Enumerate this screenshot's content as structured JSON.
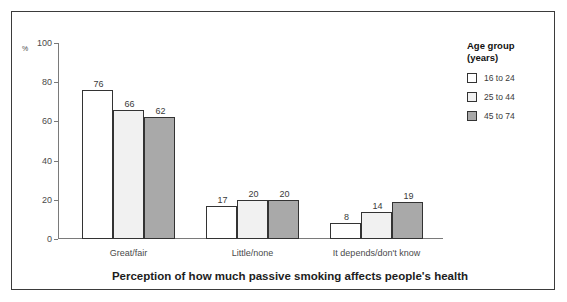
{
  "chart_data": {
    "type": "bar",
    "title": "",
    "xlabel": "Perception of how much passive smoking affects people's health",
    "ylabel": "%",
    "categories": [
      "Great/fair",
      "Little/none",
      "It depends/don't know"
    ],
    "series": [
      {
        "name": "16 to 24",
        "values": [
          76,
          17,
          8
        ],
        "color": "#ffffff"
      },
      {
        "name": "25 to 44",
        "values": [
          66,
          20,
          14
        ],
        "color": "#f1f1f1"
      },
      {
        "name": "45 to 74",
        "values": [
          62,
          20,
          19
        ],
        "color": "#a9a9a9"
      }
    ],
    "ylim": [
      0,
      100
    ],
    "yticks": [
      0,
      20,
      40,
      60,
      80,
      100
    ],
    "ytick_labels": [
      "0",
      "20",
      "40",
      "60",
      "80",
      "100"
    ],
    "grid": false,
    "legend_position": "right"
  },
  "legend": {
    "title_line1": "Age group",
    "title_line2": "(years)"
  },
  "axis": {
    "percent_symbol": "%"
  }
}
